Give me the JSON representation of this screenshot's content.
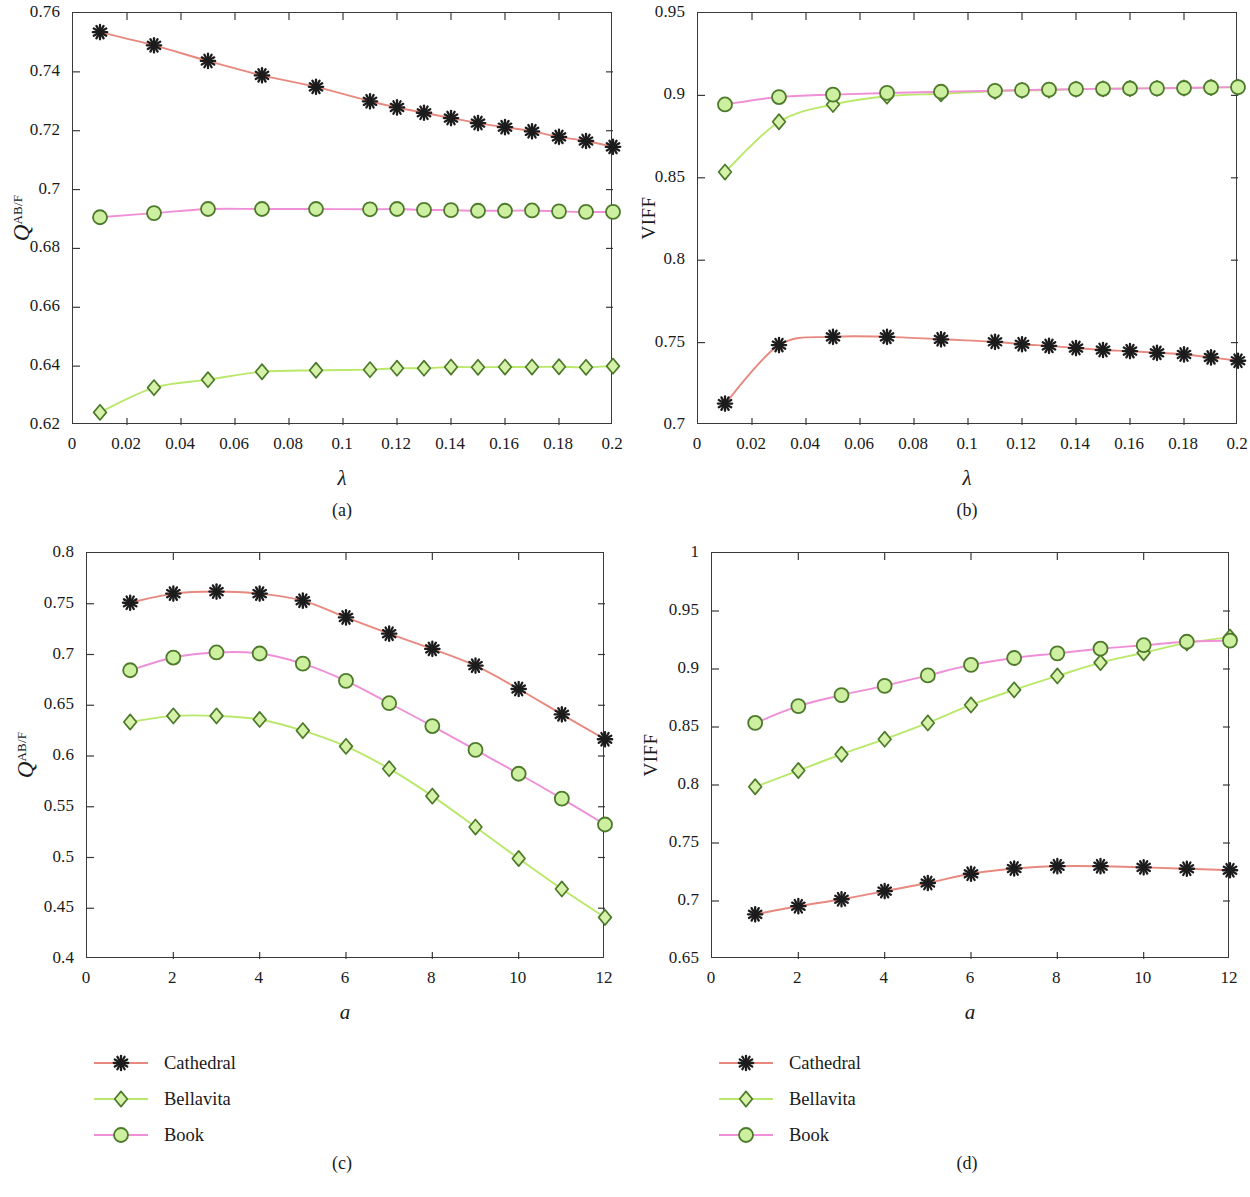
{
  "figure": {
    "series_names": [
      "Cathedral",
      "Bellavita",
      "Book"
    ],
    "colors": {
      "cathedral_line": "#e8897f",
      "cathedral_marker": "#1c1c1c",
      "bellavita_line": "#b9e86a",
      "bellavita_marker_face": "#d6f2a8",
      "bellavita_marker_edge": "#4c7a2a",
      "book_line": "#ef8fd8",
      "book_marker_face": "#cdf0a0",
      "book_marker_edge": "#4c7a2a",
      "axis": "#3a3a3a",
      "text": "#1a1a1a"
    }
  },
  "legends": [
    {
      "name": "legend-c",
      "items": [
        {
          "label": "Cathedral",
          "marker": "asterisk-marker",
          "line_color": "#e8897f"
        },
        {
          "label": "Bellavita",
          "marker": "diamond-marker",
          "line_color": "#b9e86a"
        },
        {
          "label": "Book",
          "marker": "circle-marker",
          "line_color": "#ef8fd8"
        }
      ]
    },
    {
      "name": "legend-d",
      "items": [
        {
          "label": "Cathedral",
          "marker": "asterisk-marker",
          "line_color": "#e8897f"
        },
        {
          "label": "Bellavita",
          "marker": "diamond-marker",
          "line_color": "#b9e86a"
        },
        {
          "label": "Book",
          "marker": "circle-marker",
          "line_color": "#ef8fd8"
        }
      ]
    }
  ],
  "captions": {
    "a": "(a)",
    "b": "(b)",
    "c": "(c)",
    "d": "(d)"
  },
  "chart_data": [
    {
      "panel": "a",
      "type": "line",
      "title": "",
      "xlabel": "λ",
      "ylabel": "Q^AB/F",
      "ylabel_base": "Q",
      "ylabel_sup": "AB/F",
      "xlim": [
        0,
        0.2
      ],
      "ylim": [
        0.62,
        0.76
      ],
      "xticks": [
        0,
        0.02,
        0.04,
        0.06,
        0.08,
        0.1,
        0.12,
        0.14,
        0.16,
        0.18,
        0.2
      ],
      "xticklabels": [
        "0",
        "0.02",
        "0.04",
        "0.06",
        "0.08",
        "0.1",
        "0.12",
        "0.14",
        "0.16",
        "0.18",
        "0.2"
      ],
      "yticks": [
        0.62,
        0.64,
        0.66,
        0.68,
        0.7,
        0.72,
        0.74,
        0.76
      ],
      "yticklabels": [
        "0.62",
        "0.64",
        "0.66",
        "0.68",
        "0.7",
        "0.72",
        "0.74",
        "0.76"
      ],
      "grid": false,
      "legend_position": "below-figure",
      "x": [
        0.01,
        0.03,
        0.05,
        0.07,
        0.09,
        0.11,
        0.12,
        0.13,
        0.14,
        0.15,
        0.16,
        0.17,
        0.18,
        0.19,
        0.2
      ],
      "series": [
        {
          "name": "Cathedral",
          "marker": "asterisk",
          "values": [
            0.7535,
            0.749,
            0.7437,
            0.7388,
            0.7349,
            0.73,
            0.7279,
            0.7261,
            0.7243,
            0.7226,
            0.7212,
            0.7198,
            0.7179,
            0.7165,
            0.7145
          ]
        },
        {
          "name": "Bellavita",
          "marker": "diamond",
          "values": [
            0.6243,
            0.6327,
            0.6354,
            0.6381,
            0.6386,
            0.6388,
            0.6393,
            0.6393,
            0.6397,
            0.6396,
            0.6397,
            0.6397,
            0.6398,
            0.6396,
            0.64
          ]
        },
        {
          "name": "Book",
          "marker": "circle",
          "values": [
            0.6906,
            0.692,
            0.6934,
            0.6934,
            0.6934,
            0.6933,
            0.6934,
            0.6931,
            0.693,
            0.6928,
            0.6928,
            0.6929,
            0.6926,
            0.6924,
            0.6924
          ]
        }
      ]
    },
    {
      "panel": "b",
      "type": "line",
      "title": "",
      "xlabel": "λ",
      "ylabel": "VIFF",
      "xlim": [
        0,
        0.2
      ],
      "ylim": [
        0.7,
        0.95
      ],
      "xticks": [
        0,
        0.02,
        0.04,
        0.06,
        0.08,
        0.1,
        0.12,
        0.14,
        0.16,
        0.18,
        0.2
      ],
      "xticklabels": [
        "0",
        "0.02",
        "0.04",
        "0.06",
        "0.08",
        "0.1",
        "0.12",
        "0.14",
        "0.16",
        "0.18",
        "0.2"
      ],
      "yticks": [
        0.7,
        0.75,
        0.8,
        0.85,
        0.9,
        0.95
      ],
      "yticklabels": [
        "0.7",
        "0.75",
        "0.8",
        "0.85",
        "0.9",
        "0.95"
      ],
      "grid": false,
      "legend_position": "below-figure",
      "x": [
        0.01,
        0.03,
        0.05,
        0.07,
        0.09,
        0.11,
        0.12,
        0.13,
        0.14,
        0.15,
        0.16,
        0.17,
        0.18,
        0.19,
        0.2
      ],
      "series": [
        {
          "name": "Cathedral",
          "marker": "asterisk",
          "values": [
            0.713,
            0.7485,
            0.7535,
            0.7535,
            0.752,
            0.7505,
            0.749,
            0.748,
            0.7467,
            0.7455,
            0.7448,
            0.7438,
            0.7428,
            0.741,
            0.739
          ]
        },
        {
          "name": "Bellavita",
          "marker": "diamond",
          "values": [
            0.8535,
            0.884,
            0.8945,
            0.8995,
            0.901,
            0.9025,
            0.903,
            0.9032,
            0.9038,
            0.904,
            0.9042,
            0.9043,
            0.9045,
            0.9048,
            0.905
          ]
        },
        {
          "name": "Book",
          "marker": "circle",
          "values": [
            0.8945,
            0.899,
            0.9005,
            0.9015,
            0.9022,
            0.9028,
            0.9032,
            0.9035,
            0.9038,
            0.904,
            0.9042,
            0.9043,
            0.9045,
            0.9048,
            0.905
          ]
        }
      ]
    },
    {
      "panel": "c",
      "type": "line",
      "title": "",
      "xlabel": "a",
      "ylabel": "Q^AB/F",
      "ylabel_base": "Q",
      "ylabel_sup": "AB/F",
      "xlim": [
        0,
        12
      ],
      "ylim": [
        0.4,
        0.8
      ],
      "xticks": [
        0,
        2,
        4,
        6,
        8,
        10,
        12
      ],
      "xticklabels": [
        "0",
        "2",
        "4",
        "6",
        "8",
        "10",
        "12"
      ],
      "yticks": [
        0.4,
        0.45,
        0.5,
        0.55,
        0.6,
        0.65,
        0.7,
        0.75,
        0.8
      ],
      "yticklabels": [
        "0.4",
        "0.45",
        "0.5",
        "0.55",
        "0.6",
        "0.65",
        "0.7",
        "0.75",
        "0.8"
      ],
      "grid": false,
      "legend_position": "below",
      "x": [
        1,
        2,
        3,
        4,
        5,
        6,
        7,
        8,
        9,
        10,
        11,
        12
      ],
      "series": [
        {
          "name": "Cathedral",
          "marker": "asterisk",
          "values": [
            0.751,
            0.76,
            0.762,
            0.76,
            0.753,
            0.7365,
            0.7205,
            0.7055,
            0.689,
            0.666,
            0.641,
            0.6165
          ]
        },
        {
          "name": "Bellavita",
          "marker": "diamond",
          "values": [
            0.6335,
            0.6395,
            0.6395,
            0.636,
            0.625,
            0.6095,
            0.5875,
            0.5605,
            0.53,
            0.499,
            0.469,
            0.441
          ]
        },
        {
          "name": "Book",
          "marker": "circle",
          "values": [
            0.6845,
            0.697,
            0.702,
            0.701,
            0.691,
            0.674,
            0.652,
            0.6295,
            0.606,
            0.5825,
            0.558,
            0.5325
          ]
        }
      ]
    },
    {
      "panel": "d",
      "type": "line",
      "title": "",
      "xlabel": "a",
      "ylabel": "VIFF",
      "xlim": [
        0,
        12
      ],
      "ylim": [
        0.65,
        1.0
      ],
      "xticks": [
        0,
        2,
        4,
        6,
        8,
        10,
        12
      ],
      "xticklabels": [
        "0",
        "2",
        "4",
        "6",
        "8",
        "10",
        "12"
      ],
      "yticks": [
        0.65,
        0.7,
        0.75,
        0.8,
        0.85,
        0.9,
        0.95,
        1
      ],
      "yticklabels": [
        "0.65",
        "0.7",
        "0.75",
        "0.8",
        "0.85",
        "0.9",
        "0.95",
        "1"
      ],
      "grid": false,
      "legend_position": "below",
      "x": [
        1,
        2,
        3,
        4,
        5,
        6,
        7,
        8,
        9,
        10,
        11,
        12
      ],
      "series": [
        {
          "name": "Cathedral",
          "marker": "asterisk",
          "values": [
            0.6885,
            0.6955,
            0.7015,
            0.7085,
            0.7155,
            0.7235,
            0.728,
            0.73,
            0.73,
            0.729,
            0.7278,
            0.7265
          ]
        },
        {
          "name": "Bellavita",
          "marker": "diamond",
          "values": [
            0.7985,
            0.8125,
            0.8265,
            0.8395,
            0.8535,
            0.869,
            0.882,
            0.894,
            0.9055,
            0.914,
            0.9225,
            0.9275
          ]
        },
        {
          "name": "Book",
          "marker": "circle",
          "values": [
            0.8535,
            0.868,
            0.8775,
            0.8855,
            0.8945,
            0.9035,
            0.9095,
            0.9135,
            0.9175,
            0.9205,
            0.9235,
            0.9245
          ]
        }
      ]
    }
  ]
}
